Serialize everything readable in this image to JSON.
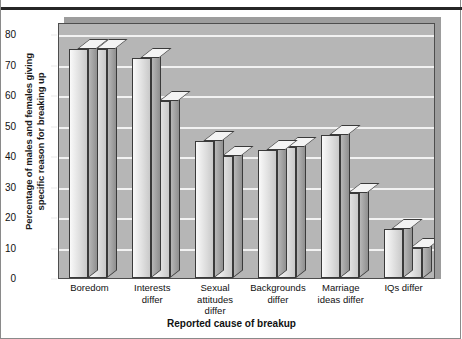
{
  "chart_data": {
    "type": "bar",
    "title": "",
    "xlabel": "Reported cause of breakup",
    "ylabel": "Percentage of males and females giving specific reason for breaking up",
    "ylabel_line1": "Percentage of males and females giving",
    "ylabel_line2": "specific reason for breaking up",
    "ylim": [
      0,
      80
    ],
    "yticks": [
      0,
      10,
      20,
      30,
      40,
      50,
      60,
      70,
      80
    ],
    "grid": true,
    "legend": "none",
    "style": "3d-bars-grayscale",
    "categories": [
      "Boredom",
      "Interests differ",
      "Sexual attitudes differ",
      "Backgrounds differ",
      "Marriage ideas differ",
      "IQs differ"
    ],
    "category_lines": [
      [
        "Boredom"
      ],
      [
        "Interests",
        "differ"
      ],
      [
        "Sexual",
        "attitudes",
        "differ"
      ],
      [
        "Backgrounds",
        "differ"
      ],
      [
        "Marriage",
        "ideas differ"
      ],
      [
        "IQs differ"
      ]
    ],
    "series": [
      {
        "name": "Males",
        "values": [
          75,
          72,
          45,
          42,
          47,
          16
        ]
      },
      {
        "name": "Females",
        "values": [
          75,
          58,
          40,
          43,
          28,
          10
        ]
      }
    ]
  },
  "colors": {
    "plot_background": "#b6b6b6",
    "gridline": "#f2f2f2",
    "bar_front": "#eaeaea",
    "bar_side": "#9d9d9d",
    "bar_top": "#f3f3f3",
    "outline": "#3a3a3a",
    "text": "#111111",
    "top_rule": "#262626"
  }
}
